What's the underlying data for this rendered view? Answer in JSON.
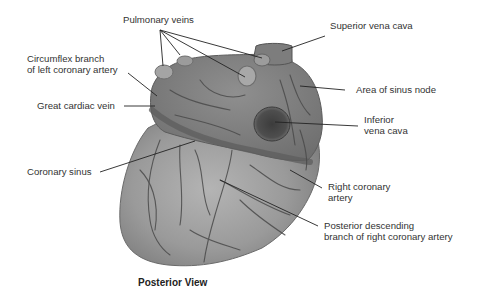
{
  "diagram": {
    "view_caption": "Posterior View",
    "colors": {
      "background": "#ffffff",
      "heart_light": "#a9a9a9",
      "heart_mid": "#8d8d8d",
      "heart_dark": "#5a5a5a",
      "vessel": "#4a4a4a",
      "leader_line": "#222222",
      "label_text": "#333333"
    },
    "labels": {
      "pulmonary_veins": "Pulmonary veins",
      "superior_vena_cava": "Superior vena cava",
      "circumflex_line1": "Circumflex branch",
      "circumflex_line2": "of left coronary artery",
      "area_sinus_node": "Area of sinus node",
      "great_cardiac_vein": "Great cardiac vein",
      "inferior_vc_line1": "Inferior",
      "inferior_vc_line2": "vena cava",
      "coronary_sinus": "Coronary sinus",
      "right_coronary_line1": "Right coronary",
      "right_coronary_line2": "artery",
      "posterior_desc_line1": "Posterior descending",
      "posterior_desc_line2": "branch of right coronary artery"
    }
  }
}
